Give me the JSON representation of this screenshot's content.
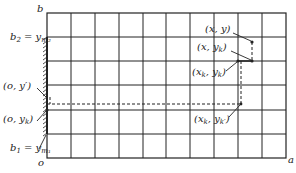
{
  "diagram": {
    "axis_labels": {
      "origin": "o",
      "x_end": "a",
      "y_end": "b"
    },
    "boundary_labels": {
      "upper": {
        "base": "b",
        "sub": "2",
        "eq": " = y",
        "eqsub": "m₂"
      },
      "lower": {
        "base": "b",
        "sub": "1",
        "eq": " = y",
        "eqsub": "m₁"
      }
    },
    "point_labels": {
      "p_xy": "(x, y)",
      "p_xyk": {
        "pre": "(x, y",
        "sub": "k",
        "post": ")"
      },
      "p_xkyk": {
        "pre": "(x",
        "sub1": "k",
        "mid": ", y",
        "sub2": "k",
        "post": ")"
      },
      "p_xkykp": {
        "pre": "(x",
        "sub1": "k",
        "mid": ", y",
        "sub2": "k′",
        "post": ")"
      },
      "p_oyp": "(o, y′)",
      "p_oyk": {
        "pre": "(o, y",
        "sub": "k",
        "post": ")"
      }
    },
    "grid": {
      "columns": 10,
      "rows": 6
    },
    "colors": {
      "line": "#222222",
      "background": "#ffffff"
    }
  }
}
